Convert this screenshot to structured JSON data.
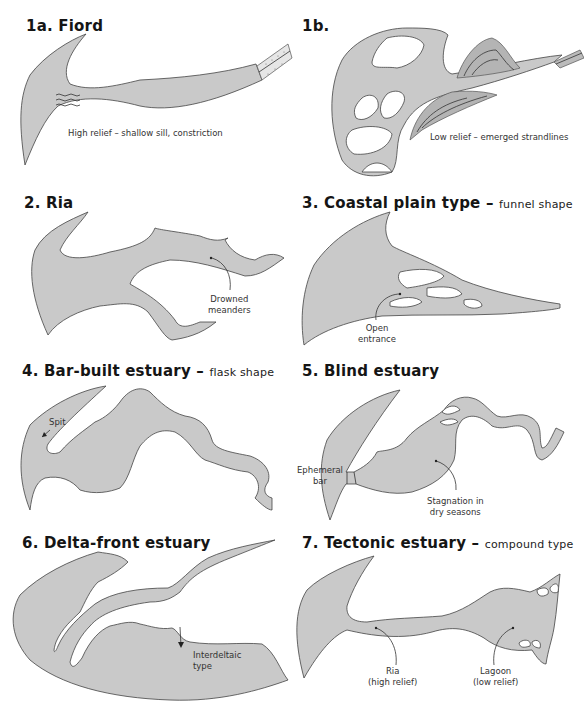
{
  "figure": {
    "fill_color": "#c9c9c9",
    "outline_color": "#444444",
    "panels": [
      {
        "id": "1a",
        "title": "1a. Fiord",
        "subtitle": "",
        "labels": [
          "High relief – shallow sill, constriction"
        ]
      },
      {
        "id": "1b",
        "title": "1b.",
        "subtitle": "",
        "labels": [
          "Low relief – emerged strandlines"
        ]
      },
      {
        "id": "2",
        "title": "2. Ria",
        "subtitle": "",
        "labels": [
          "Drowned",
          "meanders"
        ]
      },
      {
        "id": "3",
        "title": "3. Coastal plain type –",
        "subtitle": "funnel shape",
        "labels": [
          "Open",
          "entrance"
        ]
      },
      {
        "id": "4",
        "title": "4. Bar-built estuary –",
        "subtitle": "flask shape",
        "labels": [
          "Spit"
        ]
      },
      {
        "id": "5",
        "title": "5. Blind estuary",
        "subtitle": "",
        "labels": [
          "Ephemeral",
          "bar",
          "Stagnation in",
          "dry seasons"
        ]
      },
      {
        "id": "6",
        "title": "6. Delta-front estuary",
        "subtitle": "",
        "labels": [
          "Interdeltaic",
          "type"
        ]
      },
      {
        "id": "7",
        "title": "7. Tectonic estuary –",
        "subtitle": "compound type",
        "labels": [
          "Ria",
          "(high relief)",
          "Lagoon",
          "(low relief)"
        ]
      }
    ]
  }
}
